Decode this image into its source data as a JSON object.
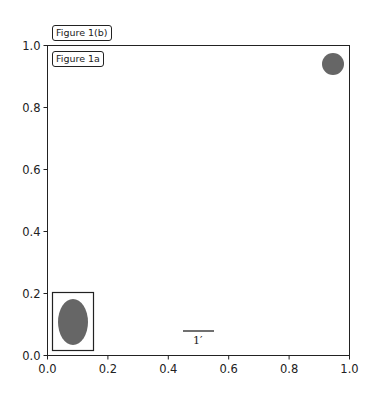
{
  "chart_data": {
    "type": "scatter",
    "title": "",
    "xlabel": "",
    "ylabel": "",
    "xlim": [
      0.0,
      1.0
    ],
    "ylim": [
      0.0,
      1.0
    ],
    "grid": false,
    "xticks": [
      "0.0",
      "0.2",
      "0.4",
      "0.6",
      "0.8",
      "1.0"
    ],
    "yticks": [
      "0.0",
      "0.2",
      "0.4",
      "0.6",
      "0.8",
      "1.0"
    ],
    "annotations": [
      {
        "text": "Figure 1(b)",
        "position": "above axes, top-left",
        "boxed": true
      },
      {
        "text": "Figure 1a",
        "position": "inside axes, top-left",
        "boxed": true
      }
    ],
    "shapes": [
      {
        "kind": "circle",
        "center": [
          0.94,
          0.94
        ],
        "radius_axes": 0.035,
        "color": "#666666"
      },
      {
        "kind": "ellipse",
        "center": [
          0.085,
          0.107
        ],
        "width": 0.1,
        "height": 0.15,
        "color": "#666666",
        "boxed": true,
        "box": [
          0.016,
          0.013,
          0.155,
          0.203
        ]
      }
    ],
    "scalebar": {
      "label": "1′",
      "x_from": 0.45,
      "x_to": 0.55,
      "y": 0.08
    }
  },
  "labels": {
    "figure_1b": "Figure 1(b)",
    "figure_1a": "Figure 1a",
    "scalebar": "1′"
  },
  "colors": {
    "shape_fill": "#666666",
    "axes": "#222222"
  }
}
